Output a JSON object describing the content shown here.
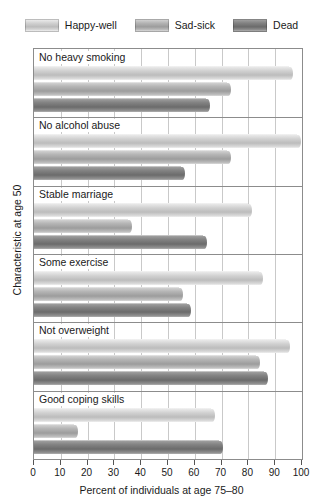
{
  "chart_data": {
    "type": "bar",
    "orientation": "horizontal",
    "title": "",
    "xlabel": "Percent of individuals at age 75–80",
    "ylabel": "Characteristic at age 50",
    "xlim": [
      0,
      100
    ],
    "xticks": [
      0,
      10,
      20,
      30,
      40,
      50,
      60,
      70,
      80,
      90,
      100
    ],
    "xticklabels": [
      "0",
      "10",
      "20",
      "30",
      "40",
      "50",
      "60",
      "70",
      "80",
      "90",
      "100"
    ],
    "grid": true,
    "grid_axis": "x",
    "legend_position": "top",
    "categories": [
      "No heavy smoking",
      "No alcohol abuse",
      "Stable marriage",
      "Some exercise",
      "Not overweight",
      "Good coping skills"
    ],
    "series": [
      {
        "name": "Happy-well",
        "color": "#d2d2d2",
        "values": [
          95,
          98,
          80,
          84,
          94,
          66
        ]
      },
      {
        "name": "Sad-sick",
        "color": "#b4b4b4",
        "values": [
          72,
          72,
          35,
          54,
          83,
          15
        ]
      },
      {
        "name": "Dead",
        "color": "#828282",
        "values": [
          64,
          55,
          63,
          57,
          86,
          69
        ]
      }
    ]
  },
  "legend": {
    "items": [
      {
        "label": "Happy-well"
      },
      {
        "label": "Sad-sick"
      },
      {
        "label": "Dead"
      }
    ]
  }
}
